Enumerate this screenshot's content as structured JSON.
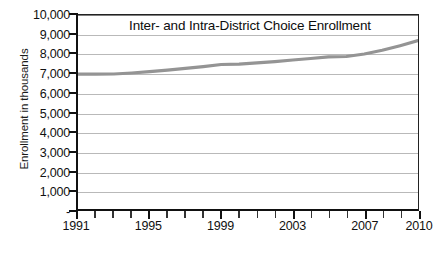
{
  "chart_data": {
    "type": "line",
    "title": "Inter- and Intra-District Choice Enrollment",
    "xlabel": "",
    "ylabel": "Enrollment in thousands",
    "ylim": [
      0,
      10000
    ],
    "xlim": [
      1991,
      2010
    ],
    "grid": true,
    "legend": "none",
    "line_color": "#949494",
    "y_ticks": [
      "-",
      "1,000",
      "2,000",
      "3,000",
      "4,000",
      "5,000",
      "6,000",
      "7,000",
      "8,000",
      "9,000",
      "10,000"
    ],
    "y_tick_values": [
      0,
      1000,
      2000,
      3000,
      4000,
      5000,
      6000,
      7000,
      8000,
      9000,
      10000
    ],
    "x_tick_labels": [
      "1991",
      "1995",
      "1999",
      "2003",
      "2007",
      "2010"
    ],
    "x_tick_label_values": [
      1991,
      1995,
      1999,
      2003,
      2007,
      2010
    ],
    "x_all_ticks": [
      1991,
      1992,
      1993,
      1994,
      1995,
      1996,
      1997,
      1998,
      1999,
      2000,
      2001,
      2002,
      2003,
      2004,
      2005,
      2006,
      2007,
      2008,
      2009,
      2010
    ],
    "series": [
      {
        "name": "Inter- and Intra-District Choice Enrollment",
        "x": [
          1991,
          1992,
          1993,
          1994,
          1995,
          1996,
          1997,
          1998,
          1999,
          2000,
          2001,
          2002,
          2003,
          2004,
          2005,
          2006,
          2007,
          2008,
          2009,
          2010
        ],
        "values": [
          6950,
          6950,
          6960,
          7010,
          7080,
          7160,
          7250,
          7340,
          7450,
          7470,
          7530,
          7600,
          7680,
          7760,
          7840,
          7860,
          7990,
          8180,
          8420,
          8680
        ]
      }
    ]
  },
  "axis": {
    "ylabel": "Enrollment in thousands"
  }
}
